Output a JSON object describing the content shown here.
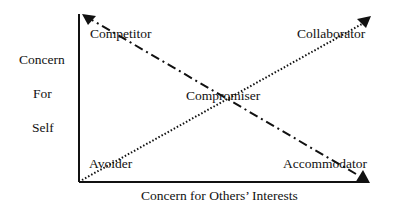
{
  "diagram": {
    "y_axis_label": [
      "Concern",
      "For",
      "Self"
    ],
    "x_axis_label": "Concern for Others’ Interests",
    "styles": [
      {
        "name": "Competitor",
        "position": "top-left"
      },
      {
        "name": "Collaborator",
        "position": "top-right"
      },
      {
        "name": "Compromiser",
        "position": "center"
      },
      {
        "name": "Avoider",
        "position": "bottom-left"
      },
      {
        "name": "Accommodator",
        "position": "bottom-right"
      }
    ],
    "lines": [
      {
        "from": "Accommodator",
        "to": "Competitor",
        "style": "dash-dot"
      },
      {
        "from": "Avoider",
        "to": "Collaborator",
        "style": "dotted"
      }
    ],
    "colors": {
      "ink": "#111111",
      "background": "#ffffff"
    }
  }
}
